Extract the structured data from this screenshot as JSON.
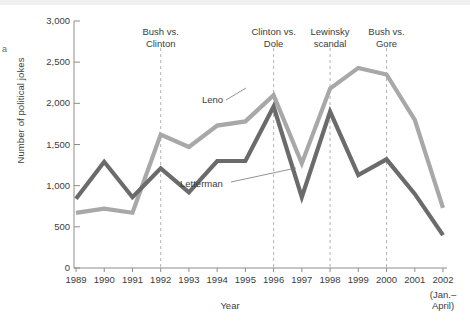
{
  "chart_data": {
    "type": "line",
    "title": "",
    "xlabel": "Year",
    "ylabel": "Number of political jokes",
    "categories": [
      "1989",
      "1990",
      "1991",
      "1992",
      "1993",
      "1994",
      "1995",
      "1996",
      "1997",
      "1998",
      "1999",
      "2000",
      "2001",
      "2002"
    ],
    "x_tick_labels": [
      "1989",
      "1990",
      "1991",
      "1992",
      "1993",
      "1994",
      "1995",
      "1996",
      "1997",
      "1998",
      "1999",
      "2000",
      "2001",
      "2002"
    ],
    "x_last_sublabel": "(Jan.–\nApril)",
    "x_last_sublabel_line1": "(Jan.–",
    "x_last_sublabel_line2": "April)",
    "y_tick_labels": [
      "0",
      "500",
      "1,000",
      "1,500",
      "2,000",
      "2,500",
      "3,000"
    ],
    "y_ticks": [
      0,
      500,
      1000,
      1500,
      2000,
      2500,
      3000
    ],
    "ylim": [
      0,
      3000
    ],
    "xlim": [
      1989,
      2002
    ],
    "grid": false,
    "legend_position": "inline-annotations",
    "series": [
      {
        "name": "Leno",
        "color": "#a8a8a8",
        "values": [
          670,
          720,
          670,
          1620,
          1470,
          1730,
          1780,
          2100,
          1270,
          2180,
          2430,
          2350,
          1800,
          730
        ]
      },
      {
        "name": "Letterman",
        "color": "#6b6b6b",
        "values": [
          840,
          1290,
          860,
          1210,
          920,
          1300,
          1300,
          1960,
          860,
          1900,
          1130,
          1320,
          900,
          400
        ]
      }
    ],
    "annotations": [
      {
        "label_line1": "Bush vs.",
        "label_line2": "Clinton",
        "year": 1992,
        "name": "bush-vs-clinton"
      },
      {
        "label_line1": "Clinton vs.",
        "label_line2": "Dole",
        "year": 1996,
        "name": "clinton-vs-dole"
      },
      {
        "label_line1": "Lewinsky",
        "label_line2": "scandal",
        "year": 1998,
        "name": "lewinsky-scandal"
      },
      {
        "label_line1": "Bush vs.",
        "label_line2": "Gore",
        "year": 2000,
        "name": "bush-vs-gore"
      }
    ],
    "series_labels": [
      {
        "name": "Leno",
        "text": "Leno"
      },
      {
        "name": "Letterman",
        "text": "Letterman"
      }
    ]
  },
  "fragment": {
    "left_edge_text": "a"
  }
}
